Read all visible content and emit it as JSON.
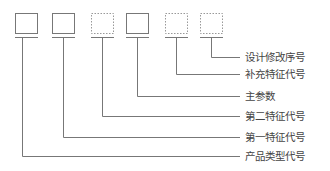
{
  "diagram": {
    "title": "",
    "boxes": [
      {
        "id": "box-1",
        "style": "solid"
      },
      {
        "id": "box-2",
        "style": "solid"
      },
      {
        "id": "box-3",
        "style": "dotted"
      },
      {
        "id": "box-4",
        "style": "solid"
      },
      {
        "id": "box-5",
        "style": "dotted"
      },
      {
        "id": "box-6",
        "style": "dotted"
      }
    ],
    "labels": {
      "design_revision": "设计修改序号",
      "supplementary_feature": "补充特征代号",
      "main_parameter": "主参数",
      "second_feature": "第二特征代号",
      "first_feature": "第一特征代号",
      "product_type": "产品类型代号"
    },
    "colors": {
      "line": "#777777",
      "text": "#444444"
    }
  }
}
